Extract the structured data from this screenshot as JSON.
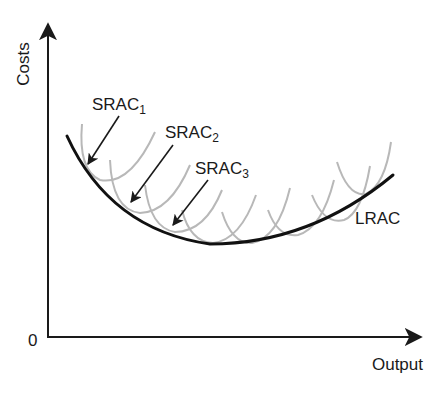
{
  "diagram": {
    "axes": {
      "y_label": "Costs",
      "x_label": "Output",
      "origin_label": "0"
    },
    "curves": {
      "lrac": {
        "label": "LRAC",
        "color": "#111111"
      },
      "srac": {
        "color": "#b8b8b8",
        "labels": [
          {
            "base": "SRAC",
            "sub": "1"
          },
          {
            "base": "SRAC",
            "sub": "2"
          },
          {
            "base": "SRAC",
            "sub": "3"
          }
        ]
      }
    },
    "colors": {
      "axis": "#1a1a1a",
      "text": "#1a1a1a",
      "background": "#ffffff"
    }
  }
}
